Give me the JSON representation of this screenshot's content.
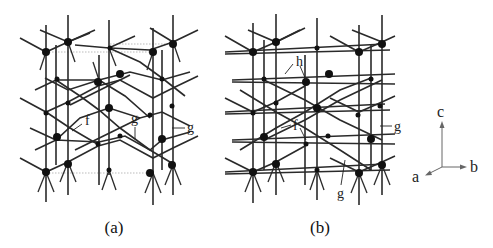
{
  "figure": {
    "panels": [
      {
        "id": "a",
        "caption": "(a)",
        "labels": [
          {
            "text": "f",
            "x": 85,
            "y": 125
          },
          {
            "text": "g",
            "x": 133,
            "y": 122
          },
          {
            "text": "g",
            "x": 187,
            "y": 132
          }
        ]
      },
      {
        "id": "b",
        "caption": "(b)",
        "labels": [
          {
            "text": "h",
            "x": 296,
            "y": 66
          },
          {
            "text": "f",
            "x": 293,
            "y": 130
          },
          {
            "text": "g",
            "x": 393,
            "y": 132
          },
          {
            "text": "g",
            "x": 339,
            "y": 198
          }
        ]
      }
    ],
    "axes": {
      "c": "c",
      "b": "b",
      "a": "a"
    },
    "colors": {
      "bond": "#2a2a2a",
      "atom": "#111111",
      "cell_outline": "#999999",
      "background": "#ffffff"
    }
  }
}
